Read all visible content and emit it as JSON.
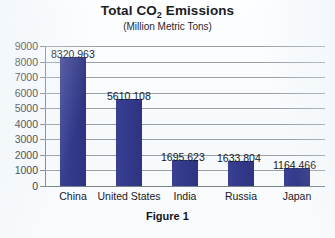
{
  "chart_data": {
    "type": "bar",
    "title": "Total CO2 Emissions",
    "title_prefix": "Total CO",
    "title_subscript": "2",
    "title_suffix": " Emissions",
    "subtitle": "(Million Metric Tons)",
    "caption": "Figure 1",
    "xlabel": "",
    "ylabel": "",
    "ylim": [
      0,
      9000
    ],
    "ytick_step": 1000,
    "grid": true,
    "legend": "none",
    "bar_color": "#343a8c",
    "categories": [
      "China",
      "United States",
      "India",
      "Russia",
      "Japan"
    ],
    "values": [
      8320.963,
      5610.108,
      1695.623,
      1633.804,
      1164.466
    ],
    "value_labels": [
      "8320.963",
      "5610.108",
      "1695.623",
      "1633.804",
      "1164.466"
    ],
    "ytick_labels": [
      "9000",
      "8000",
      "7000",
      "6000",
      "5000",
      "4000",
      "3000",
      "2000",
      "1000",
      "0"
    ]
  }
}
